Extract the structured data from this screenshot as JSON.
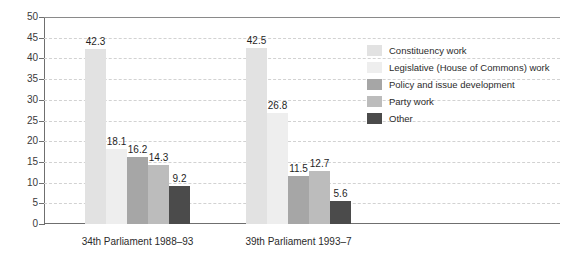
{
  "chart_data": {
    "type": "bar",
    "title": "",
    "xlabel": "",
    "ylabel": "Per cent",
    "ylim": [
      0,
      50
    ],
    "ytick_step": 5,
    "yticks": [
      "50",
      "45",
      "40",
      "35",
      "30",
      "25",
      "20",
      "15",
      "10",
      "5",
      "0"
    ],
    "grid": true,
    "legend_position": "right",
    "categories": [
      "34th Parliament 1988–93",
      "39th Parliament 1993–7"
    ],
    "series": [
      {
        "name": "Constituency work",
        "color": "#e2e2e2",
        "values": [
          42.3,
          42.5
        ],
        "labels": [
          "42.3",
          "42.5"
        ]
      },
      {
        "name": "Legislative (House of Commons) work",
        "color": "#eeeeee",
        "values": [
          18.1,
          26.8
        ],
        "labels": [
          "18.1",
          "26.8"
        ]
      },
      {
        "name": "Policy and issue development",
        "color": "#a6a6a6",
        "values": [
          16.2,
          11.5
        ],
        "labels": [
          "16.2",
          "11.5"
        ]
      },
      {
        "name": "Party work",
        "color": "#bcbcbc",
        "values": [
          14.3,
          12.7
        ],
        "labels": [
          "14.3",
          "12.7"
        ]
      },
      {
        "name": "Other",
        "color": "#4b4b4b",
        "values": [
          9.2,
          5.6
        ],
        "labels": [
          "9.2",
          "5.6"
        ]
      }
    ]
  },
  "axis": {
    "y_title": "Per cent"
  }
}
